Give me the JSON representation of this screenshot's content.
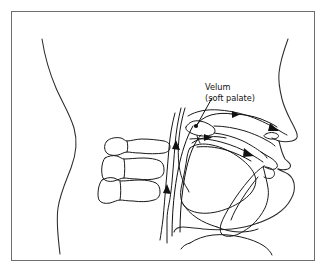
{
  "figure": {
    "domain": "diagram",
    "kind": "mid-sagittal-section-of-human-vocal-tract",
    "caption": "",
    "background_color": "#ffffff",
    "frame": {
      "visible": true,
      "border_color": "#6e6e72",
      "border_width_px": 1,
      "x": 11,
      "y": 11,
      "width": 304,
      "height": 250
    },
    "line_color": "#1a1a1a",
    "accent_color": "#111111"
  },
  "labels": {
    "velum": {
      "line1": "Velum",
      "line2": "(soft palate)",
      "x": 205,
      "y": 90,
      "font_size_px": 8.2,
      "leader_target_x": 196,
      "leader_target_y": 126
    }
  },
  "annotations": {
    "markers": [
      {
        "name": "velum-point",
        "x": 196,
        "y": 126,
        "r": 2.1
      }
    ],
    "arrows": [
      {
        "name": "nasal-airflow-arrow",
        "direction": "right",
        "x": 224,
        "y": 115
      },
      {
        "name": "nostril-outflow-arrow",
        "direction": "down-right",
        "x": 272,
        "y": 128
      },
      {
        "name": "oral-airflow-arrow",
        "direction": "right",
        "x": 208,
        "y": 138
      },
      {
        "name": "oral-outflow-arrow",
        "direction": "down-right",
        "x": 247,
        "y": 152
      },
      {
        "name": "pharynx-upflow-arrow-upper",
        "direction": "up",
        "x": 172,
        "y": 146
      },
      {
        "name": "pharynx-upflow-arrow-lower",
        "direction": "up",
        "x": 163,
        "y": 190
      }
    ]
  },
  "structures": [
    {
      "name": "head-and-neck-profile",
      "label": "head and neck outline"
    },
    {
      "name": "back-of-head-contour",
      "label": "posterior head contour"
    },
    {
      "name": "nose-profile",
      "label": "nose"
    },
    {
      "name": "nostril",
      "label": "nostril"
    },
    {
      "name": "upper-lip",
      "label": "upper lip"
    },
    {
      "name": "lower-lip",
      "label": "lower lip"
    },
    {
      "name": "chin",
      "label": "chin"
    },
    {
      "name": "hard-palate",
      "label": "hard palate"
    },
    {
      "name": "velum-soft-palate",
      "label": "velum (soft palate)"
    },
    {
      "name": "nasal-cavity",
      "label": "nasal cavity"
    },
    {
      "name": "oral-cavity",
      "label": "oral cavity"
    },
    {
      "name": "tongue",
      "label": "tongue"
    },
    {
      "name": "pharynx",
      "label": "pharynx"
    },
    {
      "name": "larynx",
      "label": "larynx"
    },
    {
      "name": "jaw",
      "label": "jaw / mandible"
    },
    {
      "name": "cervical-vertebra-1",
      "label": "cervical vertebra"
    },
    {
      "name": "cervical-vertebra-2",
      "label": "cervical vertebra"
    },
    {
      "name": "cervical-vertebra-3",
      "label": "cervical vertebra"
    },
    {
      "name": "spinal-column-anterior-wall",
      "label": "anterior spinal wall"
    }
  ]
}
